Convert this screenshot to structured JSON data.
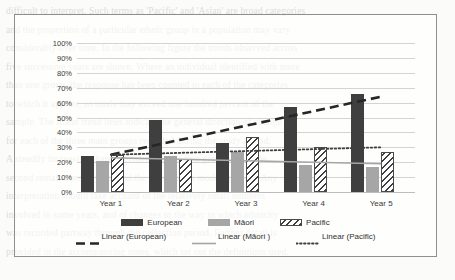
{
  "chart_data": {
    "type": "bar",
    "title": "",
    "subtitle": "",
    "xlabel": "",
    "ylabel": "",
    "categories": [
      "Year 1",
      "Year 2",
      "Year 3",
      "Year 4",
      "Year 5"
    ],
    "ylim": [
      0,
      100
    ],
    "ytick_labels": [
      "0%",
      "10%",
      "20%",
      "30%",
      "40%",
      "50%",
      "60%",
      "70%",
      "80%",
      "90%",
      "100%"
    ],
    "ytick_values": [
      0,
      10,
      20,
      30,
      40,
      50,
      60,
      70,
      80,
      90,
      100
    ],
    "grid": true,
    "legend_position": "bottom",
    "series": [
      {
        "name": "European",
        "style": "bar-solid-dark",
        "color": "#3F3F3F",
        "values": [
          24,
          48,
          33,
          57,
          66
        ]
      },
      {
        "name": "Māori",
        "style": "bar-solid-gray",
        "color": "#A6A6A6",
        "values": [
          21,
          24,
          27,
          18,
          17
        ]
      },
      {
        "name": "Pacific",
        "style": "bar-hatched",
        "color": "#FFFFFF",
        "values": [
          25,
          22,
          37,
          30,
          27
        ]
      }
    ],
    "trendlines": [
      {
        "name": "Linear (European)",
        "style": "dashed",
        "color": "#262626",
        "start_value": 25,
        "end_value": 64
      },
      {
        "name": "Linear (Māori )",
        "style": "solid",
        "color": "#A6A6A6",
        "start_value": 23,
        "end_value": 19
      },
      {
        "name": "Linear (Pacific)",
        "style": "dotted",
        "color": "#3F3F3F",
        "start_value": 25,
        "end_value": 30
      }
    ],
    "legend_rows": [
      [
        {
          "label": "European",
          "swatch": "sw-solid-dark"
        },
        {
          "label": "Māori",
          "swatch": "sw-solid-gray"
        },
        {
          "label": "Pacific",
          "swatch": "sw-hatch"
        }
      ],
      [
        {
          "label": "Linear (European)",
          "swatch": "sw-line-dashed"
        },
        {
          "label": "Linear (Māori )",
          "swatch": "sw-line-solid"
        },
        {
          "label": "Linear (Pacific)",
          "swatch": "sw-line-dotted"
        }
      ]
    ]
  },
  "background_bleed": [
    "difficult to interpret. Such terms as 'Pacific' and 'Asian' are broad categories",
    "and the proportion of a particular ethnic group in a population may vary",
    "considerably over time. In the following figure the trends observed across",
    "five successive years are shown. Where an individual identified with more",
    "than one group, the response has been counted in each of the categories",
    "to which it applies, so totals may exceed one hundred percent of the",
    "sample. The linear trend lines indicate the general direction of change",
    "for each of the three main groups recorded during the study period.",
    "A steadily increasing share is evident for the first group, while the",
    "second remains broadly flat and the third shows modest growth. Any",
    "interpretation should take account of the relatively small numbers",
    "involved in some years, and of changes to the way in which ethnicity",
    "was recorded partway through the collection period. Further detail is",
    "provided in the accompanying notes, which set out the definitions used."
  ]
}
